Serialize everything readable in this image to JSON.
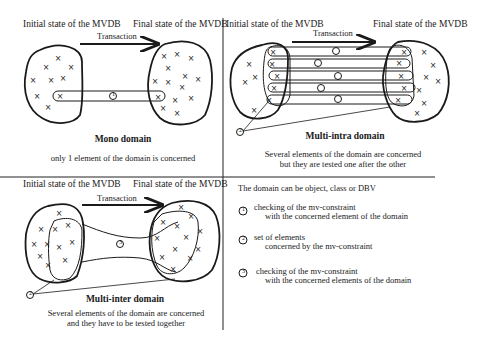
{
  "figure": {
    "panels": [
      {
        "id": "mono",
        "initial_label": "Initial state of the MVDB",
        "final_label": "Final state of the MVDB",
        "arrow_label": "Transaction",
        "title": "Mono domain",
        "caption_lines": [
          "only 1 element of the domain is concerned"
        ],
        "markers": [
          "1"
        ]
      },
      {
        "id": "multi-intra",
        "initial_label": "Initial state of the MVDB",
        "final_label": "Final state of the MVDB",
        "arrow_label": "Transaction",
        "title": "Multi-intra domain",
        "caption_lines": [
          "Several elements of the domain are concerned",
          "but they are tested one after the other"
        ],
        "markers": [
          "1",
          "1",
          "1",
          "1",
          "1",
          "2"
        ]
      },
      {
        "id": "multi-inter",
        "initial_label": "Initial state of the MVDB",
        "final_label": "Final state of the MVDB",
        "arrow_label": "Transaction",
        "title": "Multi-inter domain",
        "caption_lines": [
          "Several elements of the domain are concerned",
          "and they have to be tested together"
        ],
        "markers": [
          "3",
          "2"
        ]
      }
    ],
    "legend": {
      "heading": "The domain can be object, class or DBV",
      "items": [
        {
          "marker": "1",
          "line1": "checking of the mv-constraint",
          "line2": "with the concerned element of the domain"
        },
        {
          "marker": "2",
          "line1": "set of elements",
          "line2": "concerned by the mv-constraint"
        },
        {
          "marker": "3",
          "line1": "checking of the mv-constraint",
          "line2": "with the concerned elements of the domain"
        }
      ]
    },
    "element_symbol": "×",
    "colors": {
      "ink": "#1a1a1a",
      "background": "#ffffff"
    }
  }
}
